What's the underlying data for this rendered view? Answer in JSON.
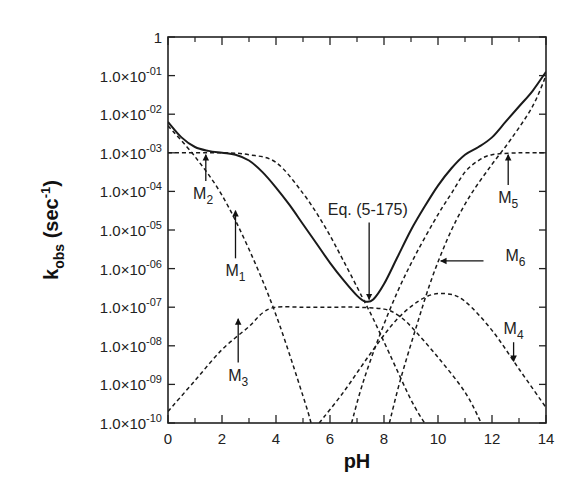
{
  "chart_data": {
    "type": "line",
    "title": "",
    "xlabel": "pH",
    "ylabel": "k_obs (sec^-1)",
    "ylabel_parts": {
      "main": "k",
      "sub": "obs",
      "rest": " (sec",
      "sup": "-1",
      "end": ")"
    },
    "xlim": [
      0,
      14
    ],
    "ylim_log10": [
      -10,
      0
    ],
    "yscale": "log",
    "grid": false,
    "x_ticks": [
      0,
      2,
      4,
      6,
      8,
      10,
      12,
      14
    ],
    "x_minor_ticks": [
      1,
      3,
      5,
      7,
      9,
      11,
      13
    ],
    "y_ticks": [
      {
        "exp": 0,
        "label": "1"
      },
      {
        "exp": -1,
        "label": "1.0×10",
        "sup": "-01"
      },
      {
        "exp": -2,
        "label": "1.0×10",
        "sup": "-02"
      },
      {
        "exp": -3,
        "label": "1.0×10",
        "sup": "-03"
      },
      {
        "exp": -4,
        "label": "1.0×10",
        "sup": "-04"
      },
      {
        "exp": -5,
        "label": "1.0×10",
        "sup": "-05"
      },
      {
        "exp": -6,
        "label": "1.0×10",
        "sup": "-06"
      },
      {
        "exp": -7,
        "label": "1.0×10",
        "sup": "-07"
      },
      {
        "exp": -8,
        "label": "1.0×10",
        "sup": "-08"
      },
      {
        "exp": -9,
        "label": "1.0×10",
        "sup": "-09"
      },
      {
        "exp": -10,
        "label": "1.0×10",
        "sup": "-10"
      }
    ],
    "series": [
      {
        "name": "Eq. (5-175)",
        "style": "solid",
        "x": [
          0,
          0.5,
          1,
          1.5,
          2,
          2.5,
          3,
          3.5,
          4,
          4.5,
          5,
          5.5,
          6,
          6.5,
          7,
          7.3,
          7.6,
          8,
          8.5,
          9,
          9.5,
          10,
          10.5,
          11,
          11.5,
          12,
          12.5,
          13,
          13.5,
          14
        ],
        "log10k": [
          -2.2,
          -2.6,
          -2.85,
          -2.95,
          -3.0,
          -3.05,
          -3.2,
          -3.5,
          -3.9,
          -4.35,
          -4.85,
          -5.35,
          -5.85,
          -6.3,
          -6.7,
          -6.85,
          -6.8,
          -6.4,
          -5.7,
          -5.0,
          -4.4,
          -3.85,
          -3.4,
          -3.05,
          -2.85,
          -2.6,
          -2.2,
          -1.8,
          -1.4,
          -0.9
        ]
      },
      {
        "name": "M1",
        "style": "dashed",
        "x": [
          0,
          1,
          2,
          3,
          4,
          5,
          5.3
        ],
        "log10k": [
          -2.3,
          -3.1,
          -4.1,
          -5.5,
          -7.2,
          -9.3,
          -10
        ]
      },
      {
        "name": "M2",
        "style": "dashed",
        "x": [
          0,
          2,
          3,
          4,
          5,
          5.8,
          6.5,
          7.2,
          7.6,
          8.2,
          9.0,
          9.5
        ],
        "log10k": [
          -3.0,
          -3.0,
          -3.05,
          -3.25,
          -4.05,
          -4.9,
          -5.8,
          -6.75,
          -7.3,
          -8.2,
          -9.4,
          -10
        ]
      },
      {
        "name": "M3",
        "style": "dashed",
        "x": [
          0,
          1,
          2,
          3,
          3.5,
          4,
          5,
          6,
          7,
          8,
          8.5,
          9,
          10,
          11,
          11.6
        ],
        "log10k": [
          -9.7,
          -8.9,
          -8.1,
          -7.5,
          -7.15,
          -7.0,
          -7.0,
          -7.0,
          -7.0,
          -7.05,
          -7.2,
          -7.5,
          -8.3,
          -9.2,
          -10
        ]
      },
      {
        "name": "M4",
        "style": "dashed",
        "x": [
          5.6,
          6.5,
          7.5,
          8.5,
          9.5,
          10.3,
          11,
          12,
          13,
          14
        ],
        "log10k": [
          -10,
          -9.2,
          -8.2,
          -7.3,
          -6.75,
          -6.65,
          -6.85,
          -7.6,
          -8.6,
          -9.6
        ]
      },
      {
        "name": "M5",
        "style": "dashed",
        "x": [
          6.8,
          7.2,
          7.8,
          8.5,
          9.2,
          10,
          10.5,
          11,
          11.5,
          12,
          13,
          14
        ],
        "log10k": [
          -10,
          -9.0,
          -7.8,
          -6.6,
          -5.6,
          -4.6,
          -4.05,
          -3.5,
          -3.2,
          -3.05,
          -3.0,
          -3.0
        ]
      },
      {
        "name": "M6",
        "style": "dashed",
        "x": [
          8.2,
          8.6,
          9.2,
          9.8,
          10.5,
          11.2,
          12,
          12.7,
          13.5,
          14
        ],
        "log10k": [
          -10,
          -8.9,
          -7.5,
          -6.2,
          -5.0,
          -4.1,
          -3.3,
          -2.65,
          -1.8,
          -1.0
        ]
      }
    ],
    "annotations": [
      {
        "text": "M",
        "sub": "1",
        "arrow_to": [
          2.5,
          -4.5
        ],
        "label_at": [
          2.5,
          -6.2
        ]
      },
      {
        "text": "M",
        "sub": "2",
        "arrow_to": [
          1.4,
          -3.05
        ],
        "label_at": [
          1.3,
          -4.2
        ]
      },
      {
        "text": "M",
        "sub": "3",
        "arrow_to": [
          2.6,
          -7.3
        ],
        "label_at": [
          2.6,
          -8.9
        ]
      },
      {
        "text": "M",
        "sub": "4",
        "arrow_to": [
          12.8,
          -8.4
        ],
        "label_at": [
          12.8,
          -7.7
        ]
      },
      {
        "text": "M",
        "sub": "5",
        "arrow_to": [
          12.6,
          -3.05
        ],
        "label_at": [
          12.6,
          -4.3
        ]
      },
      {
        "text": "M",
        "sub": "6",
        "arrow_to": [
          10.1,
          -5.8
        ],
        "label_at": [
          12.5,
          -5.8
        ]
      },
      {
        "text": "Eq. (5-175)",
        "arrow_to": [
          7.45,
          -6.8
        ],
        "label_at": [
          7.4,
          -4.6
        ]
      }
    ]
  },
  "labels": {
    "xlabel": "pH",
    "eq_label": "Eq. (5-175)"
  }
}
